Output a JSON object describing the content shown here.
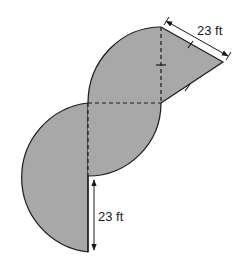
{
  "diagram": {
    "type": "composite-area-figure",
    "fill_color": "#a8a8a8",
    "stroke_color": "#1a1a1a",
    "labels": {
      "top_dimension": "23 ft",
      "bottom_dimension": "23 ft"
    },
    "parts": [
      {
        "name": "top-quarter-circle",
        "radius_ft": 23
      },
      {
        "name": "isosceles-triangle",
        "side_ft": 23,
        "tick_marks": 3
      },
      {
        "name": "middle-quarter-circle",
        "radius_ft": 23
      },
      {
        "name": "bottom-semicircle",
        "radius_ft": 23
      }
    ]
  }
}
